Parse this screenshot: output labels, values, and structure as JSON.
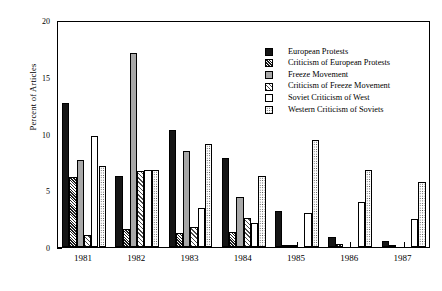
{
  "chart_data": {
    "type": "bar",
    "title": "",
    "xlabel": "",
    "ylabel": "Percent of Articles",
    "ylim": [
      0,
      20
    ],
    "ytick_labels": [
      "0",
      "5",
      "10",
      "15",
      "20"
    ],
    "ytick_values": [
      0,
      5,
      10,
      15,
      20
    ],
    "yminor_values": [
      2.5,
      7.5,
      12.5,
      17.5
    ],
    "grid": false,
    "legend_position": "top-center-inside",
    "categories": [
      "1981",
      "1982",
      "1983",
      "1984",
      "1985",
      "1986",
      "1987"
    ],
    "series": [
      {
        "name": "European Protests",
        "pattern": "solid-black",
        "values": [
          12.7,
          6.3,
          10.3,
          7.8,
          3.2,
          0.9,
          0.5
        ]
      },
      {
        "name": "Criticism of European Protests",
        "pattern": "dense-cross-hatch",
        "values": [
          6.2,
          1.6,
          1.2,
          1.3,
          0.2,
          0.3,
          0.2
        ]
      },
      {
        "name": "Freeze Movement",
        "pattern": "gray-fill",
        "values": [
          7.7,
          17.1,
          8.5,
          4.4,
          0.1,
          0.0,
          0.0
        ]
      },
      {
        "name": "Criticism of Freeze Movement",
        "pattern": "open-cross-hatch",
        "values": [
          1.1,
          6.7,
          1.8,
          2.6,
          0.0,
          0.0,
          0.0
        ]
      },
      {
        "name": "Soviet Criticism of West",
        "pattern": "white-empty",
        "values": [
          9.8,
          6.8,
          3.4,
          2.1,
          3.0,
          4.0,
          2.5
        ]
      },
      {
        "name": "Western Criticism of Soviets",
        "pattern": "stipple-dots",
        "values": [
          7.1,
          6.8,
          9.1,
          6.3,
          9.4,
          6.8,
          5.7
        ]
      }
    ]
  },
  "legend": {
    "items": [
      {
        "label": "European Protests",
        "swatch": "solid-black"
      },
      {
        "label": "Criticism of European Protests",
        "swatch": "dense-cross-hatch"
      },
      {
        "label": "Freeze Movement",
        "swatch": "gray-fill"
      },
      {
        "label": "Criticism of Freeze Movement",
        "swatch": "open-cross-hatch"
      },
      {
        "label": "Soviet Criticism of West",
        "swatch": "white-empty"
      },
      {
        "label": "Western Criticism of Soviets",
        "swatch": "stipple-dots"
      }
    ]
  },
  "axes": {
    "y_title": "Percent of Articles"
  },
  "colors": {
    "axis": "#000000",
    "series_black": "#151515",
    "series_gray": "#a8a8a8",
    "background": "#ffffff"
  }
}
